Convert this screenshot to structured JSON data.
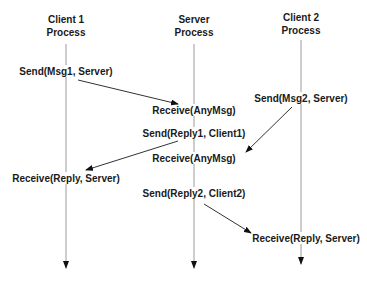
{
  "diagram": {
    "type": "message-sequence",
    "processes": [
      {
        "id": "client1",
        "line1": "Client 1",
        "line2": "Process"
      },
      {
        "id": "server",
        "line1": "Server",
        "line2": "Process"
      },
      {
        "id": "client2",
        "line1": "Client 2",
        "line2": "Process"
      }
    ],
    "events": [
      {
        "id": "e1",
        "process": "client1",
        "label": "Send(Msg1, Server)"
      },
      {
        "id": "e2",
        "process": "server",
        "label": "Receive(AnyMsg)"
      },
      {
        "id": "e3",
        "process": "server",
        "label": "Send(Reply1, Client1)"
      },
      {
        "id": "e4",
        "process": "client2",
        "label": "Send(Msg2, Server)"
      },
      {
        "id": "e5",
        "process": "server",
        "label": "Receive(AnyMsg)"
      },
      {
        "id": "e6",
        "process": "client1",
        "label": "Receive(Reply, Server)"
      },
      {
        "id": "e7",
        "process": "server",
        "label": "Send(Reply2, Client2)"
      },
      {
        "id": "e8",
        "process": "client2",
        "label": "Receive(Reply, Server)"
      }
    ],
    "messages": [
      {
        "from": "e1",
        "to": "e2",
        "content": "Msg1"
      },
      {
        "from": "e4",
        "to": "e5",
        "content": "Msg2"
      },
      {
        "from": "e3",
        "to": "e6",
        "content": "Reply1"
      },
      {
        "from": "e7",
        "to": "e8",
        "content": "Reply2"
      }
    ],
    "colors": {
      "text": "#1a1a1a",
      "lifeline": "#9a9a9a",
      "arrow": "#333333"
    }
  }
}
